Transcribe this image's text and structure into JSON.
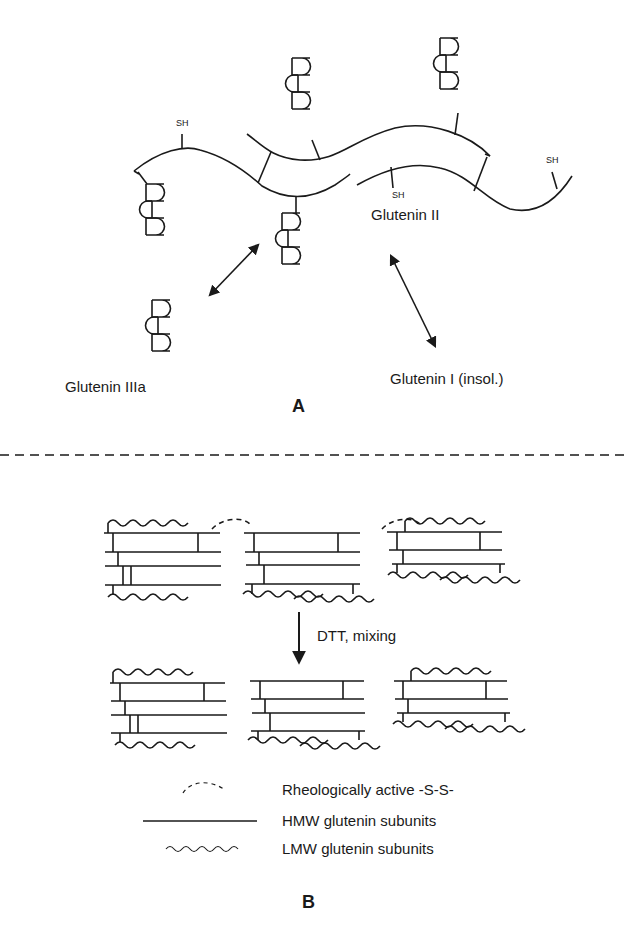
{
  "panel_a": {
    "label": "A",
    "sh_labels": [
      "SH",
      "SH",
      "SH"
    ],
    "glutenin_ii": "Glutenin  II",
    "glutenin_iiia": "Glutenin  IIIa",
    "glutenin_i": "Glutenin  I  (insol.)"
  },
  "panel_b": {
    "label": "B",
    "arrow_label": "DTT,  mixing",
    "legend": [
      {
        "symbol": "dashed-arc",
        "text": "Rheologically  active  -S-S-"
      },
      {
        "symbol": "straight-line",
        "text": "HMW  glutenin  subunits"
      },
      {
        "symbol": "wavy-line",
        "text": "LMW  glutenin  subunits"
      }
    ]
  },
  "colors": {
    "ink": "#1a1a1a",
    "background": "#ffffff"
  }
}
